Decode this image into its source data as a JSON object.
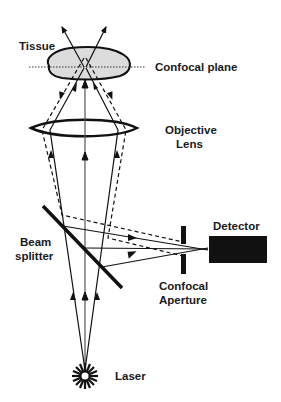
{
  "diagram": {
    "labels": {
      "tissue": "Tissue",
      "confocal_plane": "Confocal plane",
      "objective_line1": "Objective",
      "objective_line2": "Lens",
      "beam_line1": "Beam",
      "beam_line2": "splitter",
      "detector": "Detector",
      "aperture_line1": "Confocal",
      "aperture_line2": "Aperture",
      "laser": "Laser"
    },
    "components": [
      "Laser",
      "Beam splitter",
      "Objective Lens",
      "Tissue",
      "Confocal plane",
      "Confocal Aperture",
      "Detector"
    ],
    "legend": {
      "solid_rays": "in-focus light path",
      "dashed_rays": "out-of-focus light path"
    },
    "colors": {
      "ink": "#111111",
      "tissue_fill": "#dcdcdc",
      "detector_fill": "#111111",
      "background": "#ffffff"
    }
  }
}
